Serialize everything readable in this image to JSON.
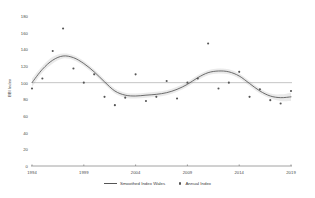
{
  "chart_data": {
    "type": "line",
    "title": "",
    "subtitle": "",
    "xlabel": "",
    "ylabel": "BBI Index",
    "xlim": [
      1994,
      2019
    ],
    "ylim": [
      0,
      180
    ],
    "grid": false,
    "legend_position": "bottom",
    "x_ticks": [
      "1994",
      "1999",
      "2004",
      "2009",
      "2014",
      "2019"
    ],
    "y_ticks": [
      "0",
      "20",
      "40",
      "60",
      "80",
      "100",
      "120",
      "140",
      "160",
      "180"
    ],
    "reference_line": 100,
    "x": [
      1994,
      1995,
      1996,
      1997,
      1998,
      1999,
      2000,
      2001,
      2002,
      2003,
      2004,
      2005,
      2006,
      2007,
      2008,
      2009,
      2010,
      2011,
      2012,
      2013,
      2014,
      2015,
      2016,
      2017,
      2018,
      2019
    ],
    "series": [
      {
        "name": "Annual Index",
        "type": "scatter",
        "values": [
          93,
          105,
          138,
          165,
          117,
          100,
          110,
          83,
          73,
          82,
          110,
          78,
          83,
          102,
          81,
          100,
          105,
          147,
          93,
          100,
          113,
          83,
          92,
          79,
          75,
          90
        ],
        "color": "#555555"
      },
      {
        "name": "Smoothed Index Wales",
        "type": "line",
        "values": [
          100,
          116,
          127,
          132,
          130,
          123,
          113,
          101,
          90,
          85,
          84,
          85,
          86,
          88,
          92,
          98,
          106,
          112,
          114,
          113,
          108,
          99,
          90,
          84,
          82,
          83
        ],
        "color": "#555555",
        "band_upper": [
          105,
          120,
          131,
          135,
          133,
          126,
          116,
          104,
          93,
          88,
          87,
          88,
          89,
          91,
          95,
          101,
          109,
          115,
          117,
          116,
          111,
          102,
          93,
          87,
          86,
          88
        ],
        "band_lower": [
          95,
          112,
          123,
          129,
          127,
          120,
          110,
          98,
          87,
          82,
          81,
          82,
          83,
          85,
          89,
          95,
          103,
          109,
          111,
          110,
          105,
          96,
          87,
          81,
          78,
          78
        ],
        "band_color": "#d8d8d8"
      }
    ]
  },
  "legend": {
    "items": [
      {
        "label": "Smoothed Index Wales",
        "marker": "line"
      },
      {
        "label": "Annual Index",
        "marker": "dot"
      }
    ]
  },
  "axes": {
    "y_title": "BBI Index"
  }
}
